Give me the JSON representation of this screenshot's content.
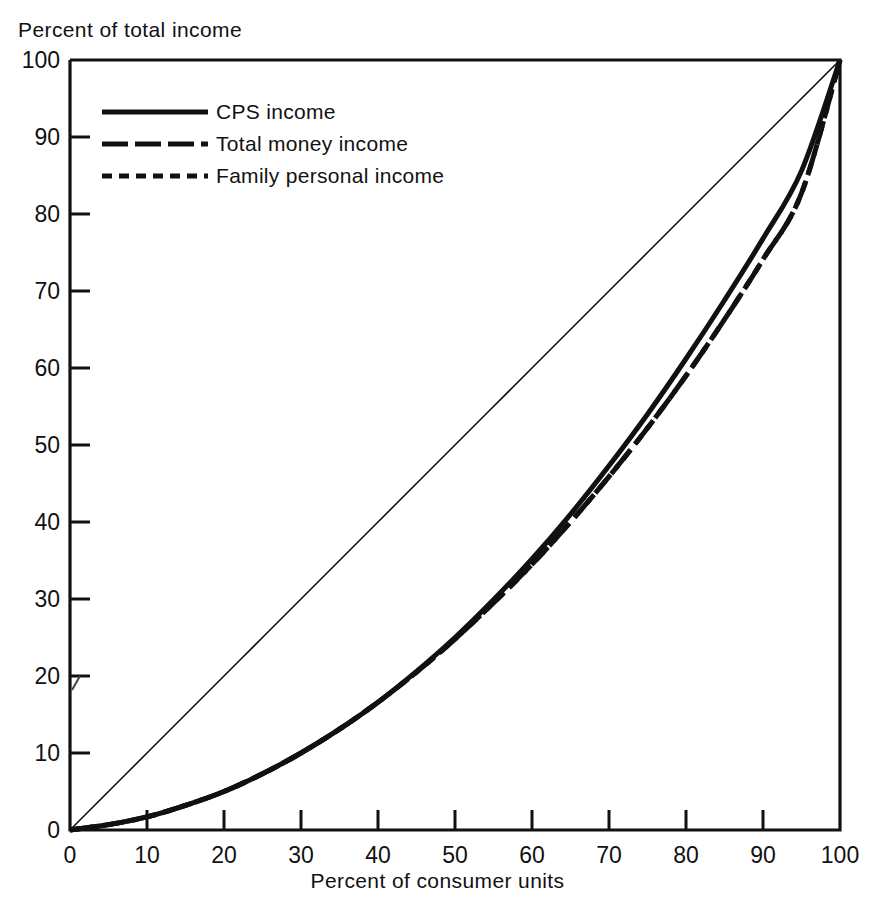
{
  "chart_data": {
    "type": "line",
    "title": "",
    "xlabel": "Percent of consumer units",
    "ylabel": "Percent of total income",
    "xlim": [
      0,
      100
    ],
    "ylim": [
      0,
      100
    ],
    "grid": false,
    "legend_position": "top-left",
    "xticks": [
      "0",
      "10",
      "20",
      "30",
      "40",
      "50",
      "60",
      "70",
      "80",
      "90",
      "100"
    ],
    "yticks": [
      "0",
      "10",
      "20",
      "30",
      "40",
      "50",
      "60",
      "70",
      "80",
      "90",
      "100"
    ],
    "x": [
      0,
      5,
      10,
      15,
      20,
      25,
      30,
      35,
      40,
      45,
      50,
      55,
      60,
      65,
      70,
      75,
      80,
      85,
      90,
      95,
      100
    ],
    "series": [
      {
        "name": "CPS income",
        "style": "solid",
        "values": [
          0,
          0.7,
          1.7,
          3.2,
          5.0,
          7.3,
          10.0,
          13.1,
          16.6,
          20.6,
          25.0,
          29.9,
          35.2,
          41.0,
          47.3,
          54.0,
          61.2,
          68.8,
          76.8,
          85.6,
          100.0
        ]
      },
      {
        "name": "Total money income",
        "style": "dashed-long",
        "values": [
          0,
          0.7,
          1.7,
          3.2,
          5.0,
          7.3,
          10.0,
          13.1,
          16.6,
          20.5,
          24.8,
          29.5,
          34.5,
          40.0,
          45.9,
          52.2,
          59.0,
          66.3,
          74.1,
          82.7,
          100.0
        ]
      },
      {
        "name": "Family personal income",
        "style": "dashed-short",
        "values": [
          0,
          0.7,
          1.7,
          3.2,
          5.0,
          7.3,
          10.0,
          13.1,
          16.6,
          20.5,
          24.8,
          29.5,
          34.5,
          40.0,
          45.9,
          52.2,
          59.0,
          66.3,
          74.1,
          82.7,
          100.0
        ]
      },
      {
        "name": "line of equality",
        "style": "thin-solid-diagonal",
        "values": [
          0,
          5,
          10,
          15,
          20,
          25,
          30,
          35,
          40,
          45,
          50,
          55,
          60,
          65,
          70,
          75,
          80,
          85,
          90,
          95,
          100
        ]
      }
    ],
    "annotations": []
  },
  "legend": {
    "items": [
      {
        "label": "CPS income",
        "style": "solid"
      },
      {
        "label": "Total money income",
        "style": "dashed-long"
      },
      {
        "label": "Family personal income",
        "style": "dashed-short"
      }
    ]
  },
  "colors": {
    "ink": "#111111",
    "background": "#ffffff"
  }
}
